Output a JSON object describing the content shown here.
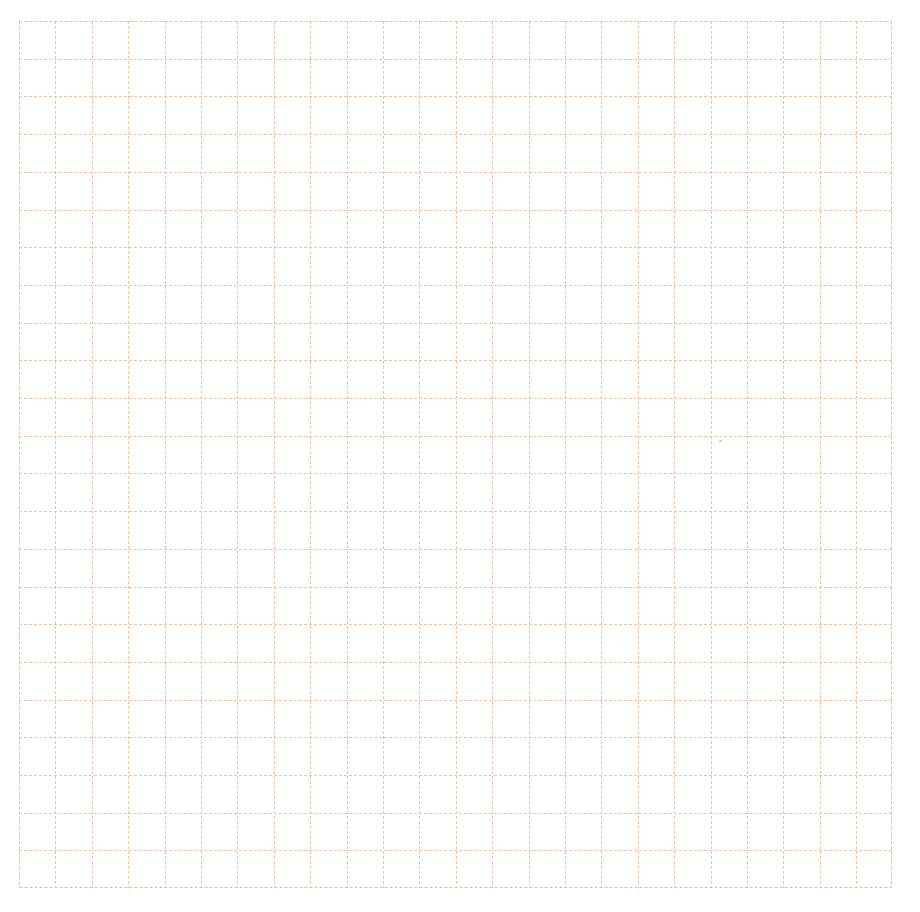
{
  "page": {
    "type": "grid-paper",
    "background_color": "#ffffff"
  },
  "header": {
    "cropped_text": "· – – – – – – – – – – – – – – – – – – – –"
  },
  "grid": {
    "columns": 24,
    "rows": 23,
    "line_color": "#f3c3a0",
    "border_color": "#f0bc96",
    "line_style": "dashed",
    "origin_x": 19,
    "origin_y": 21,
    "width": 873,
    "height": 867,
    "cell_width": 36.4,
    "cell_height": 37.7
  }
}
